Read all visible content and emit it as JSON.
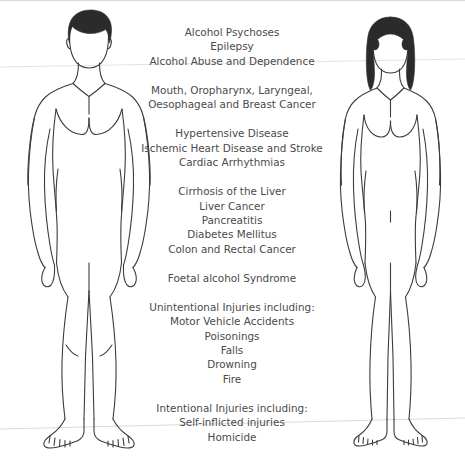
{
  "colors": {
    "text": "#4a4a4a",
    "outline": "#3a3a3a",
    "hair": "#2b2b2b",
    "background": "#ffffff",
    "ground_line": "#d0d0d0"
  },
  "figures": [
    {
      "id": "male-figure",
      "label": "Male body outline",
      "hair_style": "short-male-hair",
      "position": "left"
    },
    {
      "id": "female-figure",
      "label": "Female body outline",
      "hair_style": "long-female-hair",
      "position": "right"
    }
  ],
  "condition_groups": [
    {
      "id": "brain-neurological",
      "region": "head",
      "lines": [
        "Alcohol Psychoses",
        "Epilepsy",
        "Alcohol Abuse and Dependence"
      ]
    },
    {
      "id": "cancers-upper",
      "region": "mouth-throat-breast",
      "lines": [
        "Mouth, Oropharynx, Laryngeal,",
        "Oesophageal and Breast Cancer"
      ]
    },
    {
      "id": "cardiovascular",
      "region": "heart",
      "lines": [
        "Hypertensive Disease",
        "Ischemic Heart Disease and Stroke",
        "Cardiac Arrhythmias"
      ]
    },
    {
      "id": "digestive-metabolic",
      "region": "abdomen",
      "lines": [
        "Cirrhosis of the Liver",
        "Liver Cancer",
        "Pancreatitis",
        "Diabetes Mellitus",
        "Colon and Rectal Cancer"
      ]
    },
    {
      "id": "foetal",
      "region": "pelvis",
      "lines": [
        "Foetal alcohol Syndrome"
      ]
    },
    {
      "id": "unintentional-injuries",
      "region": "legs",
      "lines": [
        "Unintentional Injuries including:",
        "Motor Vehicle Accidents",
        "Poisonings",
        "Falls",
        "Drowning",
        "Fire"
      ]
    },
    {
      "id": "intentional-injuries",
      "region": "feet",
      "lines": [
        "Intentional Injuries including:",
        "Self-inflicted injuries",
        "Homicide"
      ]
    }
  ]
}
